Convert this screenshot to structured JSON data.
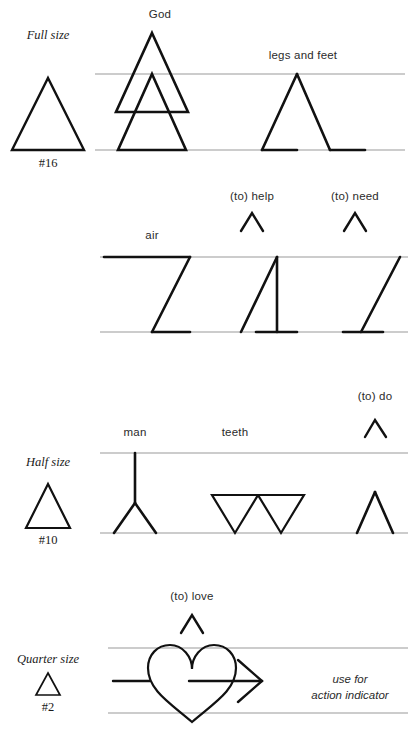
{
  "page": {
    "background": "#ffffff",
    "ink": "#1a1a1a",
    "guideline_color": "#9a9a9a"
  },
  "size_keys": [
    {
      "id": "full",
      "label": "Full size",
      "number": "#16",
      "triangle_width": 72,
      "triangle_height": 72
    },
    {
      "id": "half",
      "label": "Half size",
      "number": "#10",
      "triangle_width": 44,
      "triangle_height": 44
    },
    {
      "id": "quarter",
      "label": "Quarter size",
      "number": "#2",
      "triangle_width": 24,
      "triangle_height": 22
    }
  ],
  "rows": [
    {
      "id": "row-1",
      "top_line_y": 74,
      "base_line_y": 150,
      "glyphs": [
        {
          "id": "god",
          "label": "God",
          "label_x": 160,
          "label_y": 8
        },
        {
          "id": "legs-and-feet",
          "label": "legs and feet",
          "label_x": 303,
          "label_y": 49
        }
      ]
    },
    {
      "id": "row-2",
      "top_line_y": 257,
      "base_line_y": 332,
      "glyphs": [
        {
          "id": "air",
          "label": "air",
          "label_x": 152,
          "label_y": 229
        },
        {
          "id": "to-help",
          "label": "(to) help",
          "label_x": 252,
          "label_y": 190
        },
        {
          "id": "to-need",
          "label": "(to) need",
          "label_x": 355,
          "label_y": 190
        }
      ]
    },
    {
      "id": "row-3",
      "top_line_y": 453,
      "base_line_y": 533,
      "glyphs": [
        {
          "id": "man",
          "label": "man",
          "label_x": 135,
          "label_y": 426
        },
        {
          "id": "teeth",
          "label": "teeth",
          "label_x": 235,
          "label_y": 426
        },
        {
          "id": "to-do",
          "label": "(to) do",
          "label_x": 375,
          "label_y": 390
        }
      ]
    },
    {
      "id": "row-4",
      "top_line_y": 648,
      "base_line_y": 713,
      "glyphs": [
        {
          "id": "to-love",
          "label": "(to) love",
          "label_x": 192,
          "label_y": 590
        }
      ]
    }
  ],
  "note": {
    "line1": "use for",
    "line2": "action indicator",
    "x": 350,
    "y": 672
  }
}
